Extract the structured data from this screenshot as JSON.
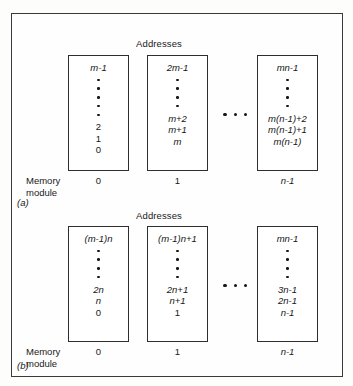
{
  "figure": {
    "panels": [
      {
        "key": "a",
        "letter": "(a)",
        "addresses_heading": "Addresses",
        "memory_module_label_line1": "Memory",
        "memory_module_label_line2": "module",
        "ellipsis": "• • •",
        "columns": [
          {
            "module_number": "0",
            "top_cells": [
              "m-1"
            ],
            "dot_count": 5,
            "bottom_cells": [
              "2",
              "1",
              "0"
            ]
          },
          {
            "module_number": "1",
            "top_cells": [
              "2m-1"
            ],
            "dot_count": 4,
            "bottom_cells": [
              "m+2",
              "m+1",
              "m"
            ]
          },
          {
            "module_number": "n-1",
            "top_cells": [
              "mn-1"
            ],
            "dot_count": 4,
            "bottom_cells": [
              "m(n-1)+2",
              "m(n-1)+1",
              "m(n-1)"
            ]
          }
        ]
      },
      {
        "key": "b",
        "letter": "(b)",
        "addresses_heading": "Addresses",
        "memory_module_label_line1": "Memory",
        "memory_module_label_line2": "module",
        "ellipsis": "• • •",
        "columns": [
          {
            "module_number": "0",
            "top_cells": [
              "(m-1)n"
            ],
            "dot_count": 4,
            "bottom_cells": [
              "2n",
              "n",
              "0"
            ]
          },
          {
            "module_number": "1",
            "top_cells": [
              "(m-1)n+1"
            ],
            "dot_count": 4,
            "bottom_cells": [
              "2n+1",
              "n+1",
              "1"
            ]
          },
          {
            "module_number": "n-1",
            "top_cells": [
              "mn-1"
            ],
            "dot_count": 4,
            "bottom_cells": [
              "3n-1",
              "2n-1",
              "n-1"
            ]
          }
        ]
      }
    ]
  }
}
